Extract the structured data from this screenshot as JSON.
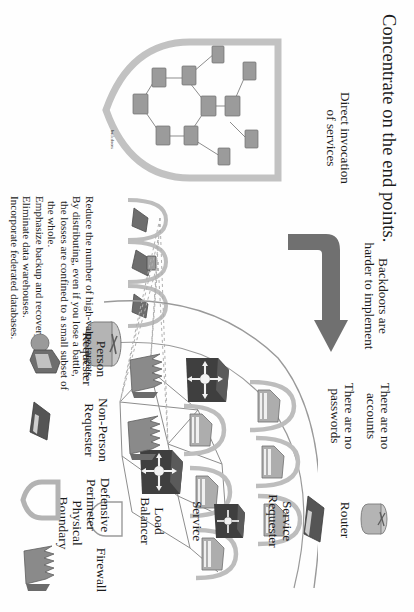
{
  "slide": {
    "title": "Concentrate on the end points.",
    "annotations": {
      "direct_invocation": "Direct invocation\nof services",
      "backdoors": "Backdoors are\nharder to implement",
      "no_accounts": "There are no\naccounts",
      "no_passwords": "There are no\npasswords",
      "backdoors_small": "backdoors"
    },
    "bullets": [
      "Reduce the number of high-value targets.",
      "By distributing, even if you lose a battle, the losses are confined to a small subset of the whole.",
      "Emphasize backup and recovery.",
      "Eliminate data warehouses.",
      "Incorporate federated databases."
    ],
    "legend": [
      {
        "label": "Router",
        "icon": "router-icon"
      },
      {
        "label": "Service\nRequester",
        "icon": "service-requester-icon"
      },
      {
        "label": "Service",
        "icon": "service-icon"
      },
      {
        "label": "Load\nBalancer",
        "icon": "load-balancer-icon"
      },
      {
        "label": "Physical\nBoundary",
        "icon": "physical-boundary-icon"
      },
      {
        "label": "Person\nRequester",
        "icon": "person-requester-icon"
      },
      {
        "label": "Non-Person\nRequester",
        "icon": "non-person-requester-icon"
      },
      {
        "label": "Defensive\nPerimeter",
        "icon": "defensive-perimeter-icon"
      },
      {
        "label": "Firewall",
        "icon": "firewall-icon"
      }
    ],
    "colors": {
      "text": "#1b1b1b",
      "arrow": "#6f6f6f",
      "perimeter": "#b9b9b9",
      "connector": "#8d8d8d",
      "dashed": "#b0b0b0",
      "service_dark": "#4a4a4a",
      "firewall": "#7c7c7c",
      "background": "#fefefe"
    }
  }
}
